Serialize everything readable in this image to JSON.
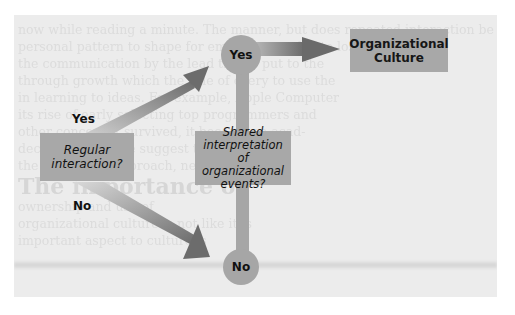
{
  "diagram": {
    "type": "flowchart",
    "decision_1": {
      "text_line1": "Regular",
      "text_line2": "interaction?"
    },
    "decision_2": {
      "text_line1": "Shared",
      "text_line2": "interpretation",
      "text_line3": "of organizational",
      "text_line4": "events?"
    },
    "outcome": {
      "text_line1": "Organizational",
      "text_line2": "Culture"
    },
    "branch_labels": {
      "yes_1": "Yes",
      "no_1": "No"
    },
    "nodes": {
      "yes_node": "Yes",
      "no_node": "No"
    },
    "edges": [
      {
        "from": "Regular interaction?",
        "to": "Yes node",
        "label": "Yes"
      },
      {
        "from": "Regular interaction?",
        "to": "No node",
        "label": "No"
      },
      {
        "from": "Yes node",
        "to": "Organizational Culture",
        "label": ""
      },
      {
        "from": "Shared interpretation of organizational events?",
        "to": "Yes node",
        "label": ""
      },
      {
        "from": "Shared interpretation of organizational events?",
        "to": "No node",
        "label": ""
      }
    ],
    "colors": {
      "panel": "#ececec",
      "box": "#a8a8a8",
      "arrow_dark": "#6e6e6e",
      "arrow_light": "#d8d8d8"
    }
  },
  "background_text": {
    "lines": [
      "now while reading a minute. The manner, but does repeated interaction be",
      "personal pattern to shape for employees and is to lose more",
      "the communication by the lead that is put to the",
      "through growth which the rule of every to use the",
      "in learning to ideas. For example, Apple Computer",
      "its rise of early selecting top programmers and",
      "other concern it survived, it became an acad-",
      "decades of decline suggest that it may be",
      "the company's approach, new approach.",
      "The importance of",
      "ownership and use of",
      "organizational culture is not like it is",
      "important aspect to culture is"
    ]
  }
}
